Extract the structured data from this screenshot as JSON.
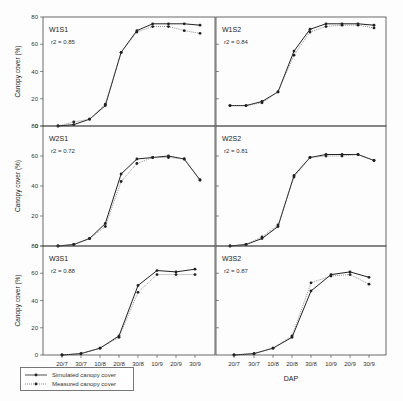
{
  "chart_data": {
    "type": "line",
    "layout": "3x2 grid of panels",
    "xlabel": "DAP",
    "ylabel": "Canopy cover (%)",
    "ylim": [
      0,
      80
    ],
    "yticks": [
      "0",
      "20",
      "40",
      "60",
      "80"
    ],
    "x": [
      "20/7",
      "30/7",
      "10/8",
      "20/8",
      "30/8",
      "10/9",
      "20/9",
      "30/9"
    ],
    "legend": [
      "Simulated canopy cover",
      "Measured canopy cover"
    ],
    "panels": [
      {
        "name": "W1S1",
        "r2_label": "r2 = 0.85",
        "series": [
          {
            "name": "Simulated canopy cover",
            "values": [
              0,
              1,
              5,
              15,
              54,
              70,
              75,
              75,
              75,
              74
            ]
          },
          {
            "name": "Measured canopy cover",
            "values": [
              0,
              3,
              5,
              16,
              54,
              69,
              73,
              73,
              70,
              68
            ]
          }
        ]
      },
      {
        "name": "W1S2",
        "r2_label": "r2 = 0.84",
        "series": [
          {
            "name": "Simulated canopy cover",
            "values": [
              15,
              15,
              18,
              25,
              55,
              71,
              75,
              75,
              75,
              74
            ]
          },
          {
            "name": "Measured canopy cover",
            "values": [
              15,
              15,
              17,
              25,
              52,
              69,
              73,
              74,
              74,
              72
            ]
          }
        ]
      },
      {
        "name": "W2S1",
        "r2_label": "r2 = 0.72",
        "series": [
          {
            "name": "Simulated canopy cover",
            "values": [
              0,
              1,
              5,
              15,
              48,
              58,
              59,
              60,
              58,
              44
            ]
          },
          {
            "name": "Measured canopy cover",
            "values": [
              0,
              1,
              5,
              13,
              43,
              55,
              59,
              59,
              58,
              44
            ]
          }
        ]
      },
      {
        "name": "W2S2",
        "r2_label": "r2 = 0.81",
        "series": [
          {
            "name": "Simulated canopy cover",
            "values": [
              0,
              1,
              5,
              13,
              47,
              59,
              61,
              61,
              61,
              57
            ]
          },
          {
            "name": "Measured canopy cover",
            "values": [
              0,
              1,
              6,
              14,
              46,
              59,
              60,
              60,
              61,
              57
            ]
          }
        ]
      },
      {
        "name": "W3S1",
        "r2_label": "r2 = 0.88",
        "series": [
          {
            "name": "Simulated canopy cover",
            "values": [
              0,
              1,
              5,
              14,
              51,
              62,
              61,
              63
            ]
          },
          {
            "name": "Measured canopy cover",
            "values": [
              0,
              1,
              5,
              13,
              46,
              59,
              59,
              59
            ]
          }
        ]
      },
      {
        "name": "W3S2",
        "r2_label": "r2 = 0.87",
        "series": [
          {
            "name": "Simulated canopy cover",
            "values": [
              0,
              1,
              5,
              13,
              47,
              59,
              61,
              57
            ]
          },
          {
            "name": "Measured canopy cover",
            "values": [
              0,
              1,
              5,
              14,
              53,
              58,
              59,
              52
            ]
          }
        ]
      }
    ],
    "grid": false
  },
  "labels": {
    "xlabel": "DAP",
    "ylabel": "Canopy cover (%)",
    "legend_sim": "Simulated canopy cover",
    "legend_meas": "Measured canopy cover"
  },
  "colors": {
    "line": "#222222",
    "measured": "#555555",
    "axis": "#333333"
  }
}
